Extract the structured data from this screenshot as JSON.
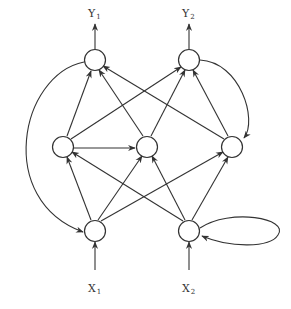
{
  "diagram": {
    "type": "recurrent neural network",
    "outputs": [
      {
        "id": "Y1",
        "label": "Y",
        "sub": "1"
      },
      {
        "id": "Y2",
        "label": "Y",
        "sub": "2"
      }
    ],
    "inputs": [
      {
        "id": "X1",
        "label": "X",
        "sub": "1"
      },
      {
        "id": "X2",
        "label": "X",
        "sub": "2"
      }
    ],
    "layers": {
      "output": [
        "o1",
        "o2"
      ],
      "hidden": [
        "h1",
        "h2",
        "h3"
      ],
      "input": [
        "i1",
        "i2"
      ]
    },
    "edges": [
      [
        "i1",
        "h1"
      ],
      [
        "i1",
        "h2"
      ],
      [
        "i1",
        "h3"
      ],
      [
        "i2",
        "h1"
      ],
      [
        "i2",
        "h2"
      ],
      [
        "i2",
        "h3"
      ],
      [
        "h1",
        "o1"
      ],
      [
        "h1",
        "o2"
      ],
      [
        "h2",
        "o1"
      ],
      [
        "h2",
        "o2"
      ],
      [
        "h3",
        "o1"
      ],
      [
        "h3",
        "o2"
      ],
      [
        "h1",
        "h2"
      ],
      [
        "o1",
        "i1",
        "feedback"
      ],
      [
        "o2",
        "h3",
        "feedback"
      ],
      [
        "i2",
        "i2",
        "self-loop"
      ]
    ]
  }
}
